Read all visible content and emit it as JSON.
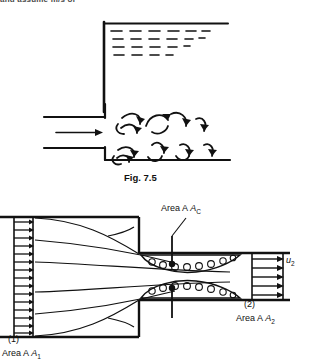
{
  "page": {
    "width": 316,
    "height": 360,
    "background": "#ffffff",
    "ink": "#111111",
    "truncated_top_text": "and assume m/s of"
  },
  "figure_upper": {
    "name": "sudden-expansion-into-tank",
    "caption": "Fig. 7.5",
    "elements": {
      "tank_wall": "vertical-left-wall",
      "free_surface": "horizontal-liquid-surface-line",
      "liquid_hatching": "dashed-horizontal-dashes",
      "inlet_pipe": "horizontal-pipe-left",
      "flow_arrow": "right-arrow",
      "eddies": "curved-swirl-arrows"
    },
    "eddy_rows": 2,
    "eddies_per_row": 5,
    "hatch_rows": [
      {
        "y": 30,
        "dashes": 8
      },
      {
        "y": 38,
        "dashes": 7
      },
      {
        "y": 46,
        "dashes": 6
      },
      {
        "y": 54,
        "dashes": 4
      }
    ]
  },
  "figure_lower": {
    "name": "sudden-contraction-vena-contracta",
    "labels": {
      "area_c": "Area A",
      "area_c_sub": "C",
      "area_1": "Area A",
      "area_1_sub": "1",
      "area_2": "Area A",
      "area_2_sub": "2",
      "station_1": "(1)",
      "station_2": "(2)",
      "velocity_2": "u",
      "velocity_2_sub": "2"
    },
    "elements": {
      "inlet_velocity_profile": "uniform-arrow-profile",
      "outlet_velocity_profile": "uniform-arrow-profile",
      "streamlines": "converging-curved-streamlines",
      "separation_eddies": "recirculation-swirl-zone",
      "vena_contracta_marker": "vertical-tick-line"
    },
    "inlet_arrow_count": 14,
    "outlet_arrow_count": 5
  }
}
